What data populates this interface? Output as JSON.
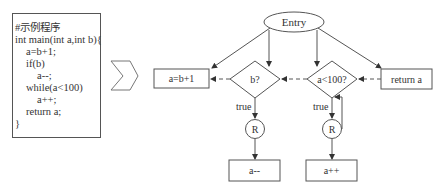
{
  "code_panel": {
    "lines": [
      {
        "text": "#示例程序",
        "indent": 0
      },
      {
        "text": "int main(int a,int b){",
        "indent": 0
      },
      {
        "text": "a=b+1;",
        "indent": 1
      },
      {
        "text": "if(b)",
        "indent": 1
      },
      {
        "text": "a--;",
        "indent": 2
      },
      {
        "text": "while(a<100)",
        "indent": 1
      },
      {
        "text": "a++;",
        "indent": 2
      },
      {
        "text": "return a;",
        "indent": 1
      },
      {
        "text": "}",
        "indent": 0
      }
    ]
  },
  "arrow_symbol": "chevron-right",
  "flowchart": {
    "entry": {
      "label": "Entry"
    },
    "nodes": {
      "assign": {
        "label": "a=b+1"
      },
      "cond_b": {
        "label": "b?"
      },
      "cond_a": {
        "label": "a<100?"
      },
      "ret": {
        "label": "return a"
      },
      "r_left": {
        "label": "R"
      },
      "r_right": {
        "label": "R"
      },
      "dec": {
        "label": "a--"
      },
      "inc": {
        "label": "a++"
      }
    },
    "edge_labels": {
      "b_true": "true",
      "a_true": "true"
    },
    "colors": {
      "stroke": "#555555",
      "text": "#333333"
    }
  }
}
